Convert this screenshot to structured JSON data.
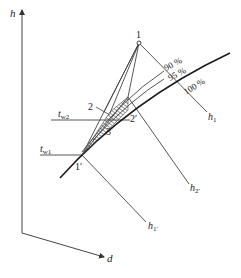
{
  "diagram": {
    "type": "h-d psychrometric chart (air-water contact process)",
    "axes": {
      "vertical_label": "h",
      "oblique_label": "d"
    },
    "points": [
      {
        "id": "1",
        "label": "1"
      },
      {
        "id": "2",
        "label": "2"
      },
      {
        "id": "2p",
        "label": "2′"
      },
      {
        "id": "3",
        "label": "3"
      },
      {
        "id": "1p",
        "label": "1′"
      }
    ],
    "enthalpy_lines": [
      {
        "id": "h1",
        "label": "h",
        "sub": "1"
      },
      {
        "id": "h2p",
        "label": "h",
        "sub": "2′"
      },
      {
        "id": "h1p",
        "label": "h",
        "sub": "1′"
      }
    ],
    "temperature_lines": [
      {
        "id": "tw2",
        "label": "t",
        "sub": "w2"
      },
      {
        "id": "tw1",
        "label": "t",
        "sub": "w1"
      }
    ],
    "humidity_curves": [
      {
        "label": "90 %"
      },
      {
        "label": "95 %"
      },
      {
        "label": "100 %"
      }
    ],
    "colors": {
      "line": "#3a3a3a",
      "saturation_curve": "#1a1a1a",
      "text": "#222222"
    }
  }
}
